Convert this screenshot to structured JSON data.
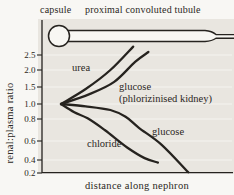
{
  "figure": {
    "diagram_labels": {
      "capsule": "capsule",
      "tubule": "proximal convoluted tubule"
    },
    "colors": {
      "ink": "#26231f",
      "panel_bg": "#e9e6e0",
      "lumen": "#f8f7f3"
    }
  },
  "chart_data": {
    "type": "line",
    "title": "",
    "xlabel": "distance along nephron",
    "ylabel": "renal:plasma ratio",
    "yticks": [
      "2.5",
      "2.0",
      "1.5",
      "1.0",
      "0.8",
      "0.6",
      "0.4",
      "0.2"
    ],
    "x_range_note": "x axis unlabeled, distance expressed as fraction 0-1 along nephron",
    "grid": "faint horizontal lines at each y tick",
    "legend_position": "labels written beside each curve",
    "series": [
      {
        "id": "urea",
        "label_lines": [
          "urea"
        ],
        "points": [
          [
            0.1,
            1.0
          ],
          [
            0.23,
            1.44
          ],
          [
            0.36,
            2.0
          ],
          [
            0.48,
            2.78
          ]
        ]
      },
      {
        "id": "glucose_phlorizinised",
        "label_lines": [
          "glucose",
          "(phlorizinised kidney)"
        ],
        "points": [
          [
            0.1,
            1.0
          ],
          [
            0.25,
            1.29
          ],
          [
            0.38,
            1.65
          ],
          [
            0.49,
            2.27
          ],
          [
            0.56,
            2.6
          ]
        ]
      },
      {
        "id": "glucose",
        "label_lines": [
          "glucose"
        ],
        "points": [
          [
            0.1,
            1.0
          ],
          [
            0.23,
            0.97
          ],
          [
            0.36,
            0.92
          ],
          [
            0.44,
            0.83
          ],
          [
            0.51,
            0.72
          ],
          [
            0.63,
            0.56
          ],
          [
            0.77,
            0.21
          ]
        ]
      },
      {
        "id": "chloride",
        "label_lines": [
          "chloride"
        ],
        "points": [
          [
            0.1,
            1.0
          ],
          [
            0.17,
            0.89
          ],
          [
            0.24,
            0.81
          ],
          [
            0.33,
            0.7
          ],
          [
            0.45,
            0.53
          ],
          [
            0.54,
            0.42
          ],
          [
            0.61,
            0.36
          ]
        ]
      }
    ]
  }
}
